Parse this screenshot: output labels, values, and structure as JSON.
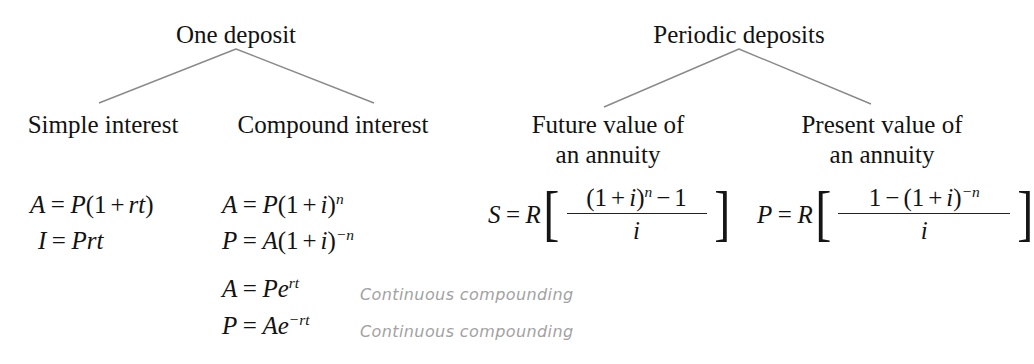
{
  "figure": {
    "background_color": "#ffffff",
    "text_color": "#121212",
    "connector_color": "#8a8a8a",
    "annotation_color": "#a2a2a2"
  },
  "trees": [
    {
      "root_label": "One deposit",
      "children": [
        {
          "label_line1": "Simple interest",
          "label_line2": ""
        },
        {
          "label_line1": "Compound interest",
          "label_line2": ""
        }
      ]
    },
    {
      "root_label": "Periodic deposits",
      "children": [
        {
          "label_line1": "Future value of",
          "label_line2": "an annuity"
        },
        {
          "label_line1": "Present value of",
          "label_line2": "an annuity"
        }
      ]
    }
  ],
  "formulas": {
    "simple_interest": [
      {
        "lhs": "A",
        "eq": "=",
        "rhs_plain": "P(1 + rt)"
      },
      {
        "lhs": "I",
        "eq": "=",
        "rhs_plain": "Prt"
      }
    ],
    "compound_interest": [
      {
        "lhs": "A",
        "eq": "=",
        "rhs_plain": "P(1 + i)",
        "exponent": "n",
        "note": ""
      },
      {
        "lhs": "P",
        "eq": "=",
        "rhs_plain": "A(1 + i)",
        "exponent": "-n",
        "note": ""
      },
      {
        "lhs": "A",
        "eq": "=",
        "rhs_plain": "Pe",
        "exponent": "rt",
        "note": "Continuous compounding"
      },
      {
        "lhs": "P",
        "eq": "=",
        "rhs_plain": "Ae",
        "exponent": "-rt",
        "note": "Continuous compounding"
      }
    ],
    "future_value_annuity": {
      "lhs": "S",
      "eq": "=",
      "coefficient": "R",
      "bracket_left": "[",
      "bracket_right": "]",
      "numerator": "(1 + i)",
      "numerator_exponent": "n",
      "numerator_tail": "− 1",
      "denominator": "i"
    },
    "present_value_annuity": {
      "lhs": "P",
      "eq": "=",
      "coefficient": "R",
      "bracket_left": "[",
      "bracket_right": "]",
      "numerator_head": "1 −",
      "numerator": "(1 + i)",
      "numerator_exponent": "-n",
      "denominator": "i"
    }
  }
}
